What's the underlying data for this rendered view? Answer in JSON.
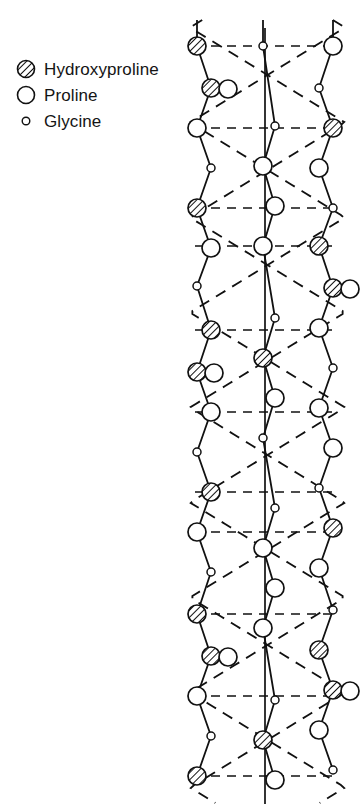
{
  "figure": {
    "name": "collagen-triple-helix-molecular-model",
    "cropped_title_fragment": "STRUCTURAL MECHANICS OF",
    "background_color": "#ffffff",
    "ink_color": "#111111"
  },
  "legend": {
    "items": [
      {
        "marker": "hatched-circle",
        "label": "Hydroxyproline",
        "size": 18
      },
      {
        "marker": "open-circle",
        "label": "Proline",
        "size": 18
      },
      {
        "marker": "small-circle",
        "label": "Glycine",
        "size": 8
      }
    ]
  },
  "chart_data": {
    "type": "diagram",
    "xlabel": "",
    "ylabel": "",
    "grid": false,
    "legend_position": "top-left",
    "axis_line": {
      "x": 265,
      "y_from": 28,
      "y_to": 804
    },
    "chain_x": {
      "left": 197,
      "middle": 263,
      "right": 333
    },
    "residue_period_px": 190,
    "bond_spacing_px": 38,
    "series": [
      {
        "name": "left-chain",
        "residues": [
          {
            "y": 46,
            "type": "hatched-circle"
          },
          {
            "y": 88,
            "type": "pair-hatched-open"
          },
          {
            "y": 128,
            "type": "open-circle"
          },
          {
            "y": 168,
            "type": "small-circle"
          },
          {
            "y": 208,
            "type": "hatched-circle"
          },
          {
            "y": 248,
            "type": "open-circle"
          },
          {
            "y": 286,
            "type": "small-circle"
          },
          {
            "y": 330,
            "type": "hatched-circle"
          },
          {
            "y": 372,
            "type": "pair-hatched-open"
          },
          {
            "y": 412,
            "type": "open-circle"
          },
          {
            "y": 452,
            "type": "small-circle"
          },
          {
            "y": 492,
            "type": "hatched-circle"
          },
          {
            "y": 532,
            "type": "open-circle"
          },
          {
            "y": 572,
            "type": "small-circle"
          },
          {
            "y": 614,
            "type": "hatched-circle"
          },
          {
            "y": 656,
            "type": "pair-hatched-open"
          },
          {
            "y": 696,
            "type": "open-circle"
          },
          {
            "y": 736,
            "type": "small-circle"
          },
          {
            "y": 776,
            "type": "hatched-circle"
          }
        ]
      },
      {
        "name": "middle-chain",
        "residues": [
          {
            "y": 46,
            "type": "small-circle"
          },
          {
            "y": 126,
            "type": "small-circle"
          },
          {
            "y": 166,
            "type": "open-circle"
          },
          {
            "y": 206,
            "type": "open-circle"
          },
          {
            "y": 246,
            "type": "open-circle"
          },
          {
            "y": 318,
            "type": "small-circle"
          },
          {
            "y": 358,
            "type": "hatched-circle"
          },
          {
            "y": 398,
            "type": "open-circle"
          },
          {
            "y": 438,
            "type": "small-circle"
          },
          {
            "y": 508,
            "type": "small-circle"
          },
          {
            "y": 548,
            "type": "open-circle"
          },
          {
            "y": 588,
            "type": "open-circle"
          },
          {
            "y": 628,
            "type": "open-circle"
          },
          {
            "y": 700,
            "type": "small-circle"
          },
          {
            "y": 740,
            "type": "hatched-circle"
          },
          {
            "y": 780,
            "type": "open-circle"
          }
        ]
      },
      {
        "name": "right-chain",
        "residues": [
          {
            "y": 46,
            "type": "open-circle"
          },
          {
            "y": 88,
            "type": "small-circle"
          },
          {
            "y": 128,
            "type": "hatched-circle"
          },
          {
            "y": 168,
            "type": "open-circle"
          },
          {
            "y": 208,
            "type": "small-circle"
          },
          {
            "y": 246,
            "type": "hatched-circle"
          },
          {
            "y": 288,
            "type": "pair-hatched-open"
          },
          {
            "y": 328,
            "type": "open-circle"
          },
          {
            "y": 368,
            "type": "small-circle"
          },
          {
            "y": 408,
            "type": "open-circle"
          },
          {
            "y": 448,
            "type": "open-circle"
          },
          {
            "y": 488,
            "type": "small-circle"
          },
          {
            "y": 528,
            "type": "hatched-circle"
          },
          {
            "y": 568,
            "type": "open-circle"
          },
          {
            "y": 610,
            "type": "small-circle"
          },
          {
            "y": 650,
            "type": "hatched-circle"
          },
          {
            "y": 690,
            "type": "pair-hatched-open"
          },
          {
            "y": 730,
            "type": "open-circle"
          },
          {
            "y": 770,
            "type": "small-circle"
          }
        ]
      }
    ],
    "hydrogen_bond_rows_y": [
      46,
      128,
      208,
      246,
      330,
      412,
      492,
      532,
      614,
      696,
      776
    ],
    "superhelix": {
      "x_min": 190,
      "x_max": 345,
      "period_px": 190,
      "phase_offset_px": 20,
      "style": "dashed"
    }
  }
}
